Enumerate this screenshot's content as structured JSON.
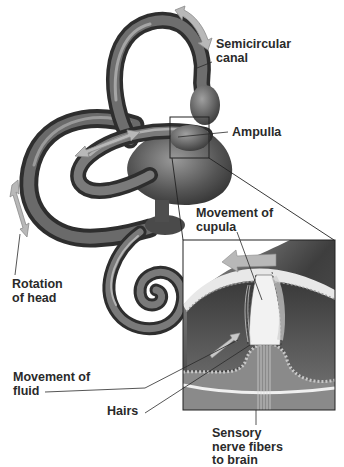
{
  "diagram": {
    "labels": {
      "semicircular_canal": "Semicircular\ncanal",
      "ampulla": "Ampulla",
      "movement_of_cupula": "Movement of\ncupula",
      "rotation_of_head": "Rotation\nof head",
      "movement_of_fluid": "Movement of\nfluid",
      "hairs": "Hairs",
      "sensory_nerve_fibers": "Sensory\nnerve fibers\nto brain"
    },
    "colors": {
      "background": "#ffffff",
      "canal_dark": "#3a3a3a",
      "canal_mid": "#6e6e6e",
      "canal_light": "#b5b5b5",
      "arrow_fill": "#b8b8b8",
      "arrow_stroke": "#8a8a8a",
      "inset_dark": "#4a4a4a",
      "cupula": "#f2f2f2",
      "label_text": "#2a2a2a",
      "leader_line": "#2a2a2a"
    }
  }
}
